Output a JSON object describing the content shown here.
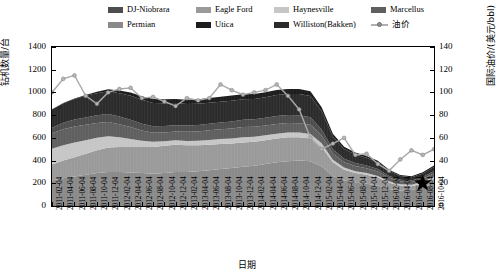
{
  "legend": {
    "items": [
      {
        "label": "DJ-Niobrara",
        "color": "#4d4d4d",
        "marker": "swatch"
      },
      {
        "label": "Eagle Ford",
        "color": "#9a9a9a",
        "marker": "swatch"
      },
      {
        "label": "Haynesville",
        "color": "#c6c6c6",
        "marker": "swatch"
      },
      {
        "label": "Marcellus",
        "color": "#5f5f5f",
        "marker": "swatch"
      },
      {
        "label": "Permian",
        "color": "#8a8a8a",
        "marker": "swatch"
      },
      {
        "label": "Utica",
        "color": "#1c1c1c",
        "marker": "swatch"
      },
      {
        "label": "Williston(Bakken)",
        "color": "#2b2b2b",
        "marker": "swatch"
      },
      {
        "label": "油价",
        "color": "#a9a9a9",
        "marker": "line-marker"
      }
    ]
  },
  "axes": {
    "y_left": {
      "title": "钻机数量/台",
      "ticks": [
        "0",
        "200",
        "400",
        "600",
        "800",
        "1000",
        "1200",
        "1400"
      ],
      "min": 0,
      "max": 1400
    },
    "y_right": {
      "title": "国际油价/(美元/bbl)",
      "ticks": [
        "0",
        "20",
        "40",
        "60",
        "80",
        "100",
        "120",
        "140"
      ],
      "min": 0,
      "max": 140
    },
    "x": {
      "title": "日期",
      "ticks": [
        "2011-02-04",
        "2011-04-04",
        "2011-06-04",
        "2011-08-04",
        "2011-10-04",
        "2011-12-04",
        "2012-02-04",
        "2012-04-04",
        "2012-06-04",
        "2012-08-04",
        "2012-10-04",
        "2012-12-04",
        "2013-02-04",
        "2013-04-04",
        "2013-06-04",
        "2013-08-04",
        "2013-10-04",
        "2013-12-04",
        "2014-02-04",
        "2014-04-04",
        "2014-06-04",
        "2014-08-04",
        "2014-10-04",
        "2014-12-04",
        "2015-02-04",
        "2015-04-04",
        "2015-06-04",
        "2015-08-04",
        "2015-10-04",
        "2015-12-04",
        "2016-02-04",
        "2016-04-04",
        "2016-06-04",
        "2016-08-04",
        "2016-10-04"
      ]
    }
  },
  "annotations": [
    {
      "name": "star-marker",
      "shape": "star",
      "color": "#000000",
      "x_value": "2016-08-04",
      "y_value_right": 20
    }
  ],
  "chart_data": {
    "type": "area",
    "title": "",
    "xlabel": "日期",
    "ylabel": "钻机数量/台",
    "ylabel_secondary": "国际油价/(美元/bbl)",
    "ylim": [
      0,
      1400
    ],
    "ylim_secondary": [
      0,
      140
    ],
    "grid": false,
    "legend_position": "top",
    "stacked": true,
    "x": [
      "2011-02-04",
      "2011-04-04",
      "2011-06-04",
      "2011-08-04",
      "2011-10-04",
      "2011-12-04",
      "2012-02-04",
      "2012-04-04",
      "2012-06-04",
      "2012-08-04",
      "2012-10-04",
      "2012-12-04",
      "2013-02-04",
      "2013-04-04",
      "2013-06-04",
      "2013-08-04",
      "2013-10-04",
      "2013-12-04",
      "2014-02-04",
      "2014-04-04",
      "2014-06-04",
      "2014-08-04",
      "2014-10-04",
      "2014-12-04",
      "2015-02-04",
      "2015-04-04",
      "2015-06-04",
      "2015-08-04",
      "2015-10-04",
      "2015-12-04",
      "2016-02-04",
      "2016-04-04",
      "2016-06-04",
      "2016-08-04",
      "2016-10-04"
    ],
    "series": [
      {
        "name": "Permian",
        "color": "#8a8a8a",
        "values": [
          225,
          245,
          260,
          275,
          290,
          300,
          300,
          295,
          290,
          285,
          290,
          300,
          300,
          305,
          315,
          325,
          335,
          345,
          355,
          370,
          385,
          395,
          400,
          395,
          350,
          265,
          225,
          205,
          195,
          180,
          150,
          135,
          140,
          165,
          200
        ]
      },
      {
        "name": "Eagle Ford",
        "color": "#9a9a9a",
        "values": [
          140,
          155,
          170,
          185,
          200,
          215,
          220,
          225,
          230,
          235,
          240,
          240,
          235,
          230,
          225,
          220,
          215,
          215,
          210,
          210,
          210,
          210,
          205,
          200,
          170,
          120,
          95,
          85,
          80,
          70,
          55,
          45,
          35,
          35,
          40
        ]
      },
      {
        "name": "Haynesville",
        "color": "#c6c6c6",
        "values": [
          140,
          135,
          130,
          120,
          110,
          100,
          85,
          70,
          55,
          45,
          40,
          38,
          38,
          40,
          42,
          44,
          45,
          45,
          44,
          42,
          42,
          42,
          42,
          40,
          32,
          22,
          18,
          17,
          16,
          15,
          13,
          12,
          12,
          14,
          18
        ]
      },
      {
        "name": "Marcellus",
        "color": "#5f5f5f",
        "values": [
          135,
          140,
          140,
          135,
          130,
          125,
          115,
          105,
          90,
          80,
          78,
          78,
          80,
          82,
          84,
          86,
          88,
          90,
          88,
          86,
          86,
          84,
          82,
          80,
          70,
          55,
          48,
          45,
          42,
          38,
          30,
          26,
          24,
          26,
          30
        ]
      },
      {
        "name": "DJ-Niobrara",
        "color": "#4d4d4d",
        "values": [
          50,
          58,
          62,
          65,
          68,
          70,
          68,
          65,
          60,
          58,
          56,
          55,
          55,
          56,
          58,
          60,
          62,
          64,
          66,
          68,
          70,
          70,
          70,
          66,
          52,
          38,
          30,
          26,
          24,
          22,
          16,
          14,
          14,
          16,
          20
        ]
      },
      {
        "name": "Williston(Bakken)",
        "color": "#2b2b2b",
        "values": [
          160,
          170,
          180,
          190,
          195,
          200,
          205,
          210,
          210,
          205,
          200,
          195,
          190,
          188,
          186,
          184,
          182,
          180,
          180,
          182,
          184,
          186,
          188,
          188,
          160,
          110,
          85,
          75,
          68,
          60,
          45,
          32,
          28,
          30,
          35
        ]
      },
      {
        "name": "Utica",
        "color": "#1c1c1c",
        "values": [
          2,
          3,
          5,
          8,
          12,
          18,
          25,
          30,
          32,
          34,
          35,
          36,
          38,
          40,
          42,
          44,
          45,
          45,
          44,
          44,
          44,
          44,
          44,
          42,
          36,
          26,
          20,
          18,
          16,
          14,
          11,
          10,
          10,
          11,
          13
        ]
      }
    ],
    "line_series": {
      "name": "油价",
      "color": "#a9a9a9",
      "axis": "right",
      "marker": "circle",
      "values": [
        100,
        112,
        115,
        97,
        90,
        100,
        103,
        104,
        95,
        96,
        92,
        88,
        95,
        93,
        95,
        107,
        102,
        98,
        100,
        102,
        107,
        97,
        85,
        60,
        50,
        55,
        60,
        45,
        46,
        37,
        31,
        41,
        49,
        45,
        50
      ]
    }
  }
}
